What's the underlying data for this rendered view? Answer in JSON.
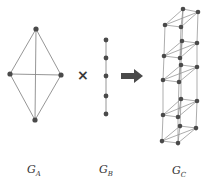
{
  "figure": {
    "graphs": [
      {
        "id": "GA",
        "label": "G",
        "subscript": "A",
        "nodes": [
          [
            36,
            29
          ],
          [
            10,
            74
          ],
          [
            61,
            75
          ],
          [
            35,
            120
          ]
        ],
        "edges": [
          [
            0,
            1
          ],
          [
            0,
            2
          ],
          [
            1,
            3
          ],
          [
            2,
            3
          ],
          [
            0,
            3
          ],
          [
            1,
            2
          ]
        ]
      },
      {
        "id": "GB",
        "label": "G",
        "subscript": "B",
        "nodes": [
          [
            106,
            40
          ],
          [
            106,
            58
          ],
          [
            106,
            76
          ],
          [
            106,
            96
          ],
          [
            106,
            114
          ]
        ],
        "edges": [
          [
            0,
            1
          ],
          [
            1,
            2
          ],
          [
            2,
            3
          ],
          [
            3,
            4
          ]
        ]
      },
      {
        "id": "GC",
        "label": "G",
        "subscript": "C",
        "layers": [
          [
            [
              183,
              9
            ],
            [
              198,
              12
            ],
            [
              165,
              25
            ],
            [
              181,
              27
            ]
          ],
          [
            [
              182,
              41
            ],
            [
              197,
              43
            ],
            [
              164,
              56
            ],
            [
              180,
              58
            ]
          ],
          [
            [
              181,
              65
            ],
            [
              197,
              67
            ],
            [
              163,
              80
            ],
            [
              179,
              82
            ]
          ],
          [
            [
              181,
              99
            ],
            [
              197,
              101
            ],
            [
              163,
              115
            ],
            [
              178,
              117
            ]
          ],
          [
            [
              180,
              126
            ],
            [
              196,
              128
            ],
            [
              162,
              141
            ],
            [
              178,
              143
            ]
          ]
        ],
        "layer_edges": [
          [
            0,
            1
          ],
          [
            0,
            2
          ],
          [
            1,
            3
          ],
          [
            2,
            3
          ],
          [
            0,
            3
          ],
          [
            1,
            2
          ]
        ]
      }
    ],
    "operator_symbol": "×",
    "arrow_symbol": "right-arrow",
    "colors": {
      "edge": "#8a8a8a",
      "node": "#4a4a4a",
      "arrow": "#4a4a4a",
      "text": "#333333"
    },
    "labels": {
      "ga": {
        "main": "G",
        "sub": "A"
      },
      "gb": {
        "main": "G",
        "sub": "B"
      },
      "gc": {
        "main": "G",
        "sub": "C"
      }
    }
  }
}
